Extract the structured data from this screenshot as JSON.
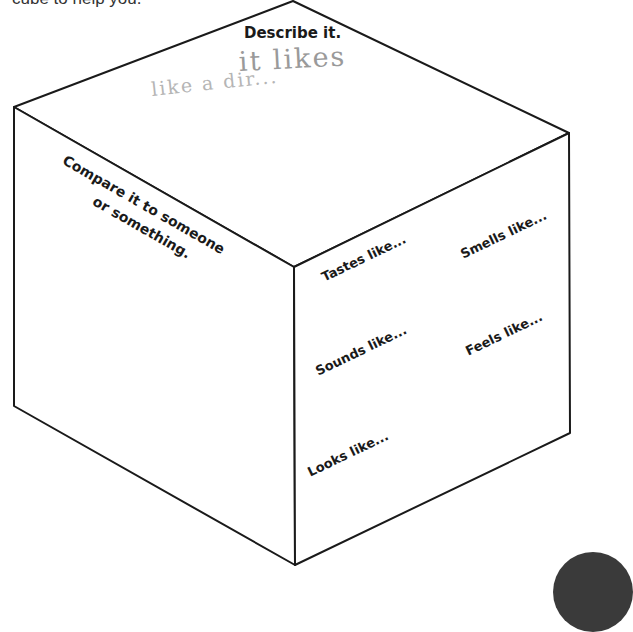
{
  "instructions": {
    "text": "cube to help you."
  },
  "cube": {
    "stroke_color": "#1a1a1a",
    "top_face": {
      "prompt": "Describe it.",
      "handwriting_line1": "it likes",
      "handwriting_line2": "like  a  dir..."
    },
    "left_face": {
      "prompt_line1": "Compare it to someone",
      "prompt_line2": "or something."
    },
    "right_face": {
      "prompts": [
        {
          "label": "Tastes like..."
        },
        {
          "label": "Smells like..."
        },
        {
          "label": "Sounds like..."
        },
        {
          "label": "Feels like..."
        },
        {
          "label": "Looks like..."
        }
      ]
    }
  },
  "colors": {
    "background": "#ffffff",
    "line": "#1a1a1a",
    "handwriting": "#9a9a9a",
    "corner_tab": "#3a3a3a"
  }
}
